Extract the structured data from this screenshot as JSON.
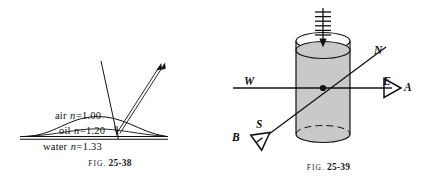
{
  "page": {
    "background_color": "#ffffff",
    "ink_color": "#111111",
    "width": 437,
    "height": 184
  },
  "figures": [
    {
      "id": "fig-25-38",
      "caption_prefix": "FIG.",
      "caption_number": "25-38",
      "description": "Light ray striking an oil film floating on water, showing reflected and refracted rays",
      "labels": [
        {
          "name": "air-label",
          "medium": "air",
          "symbol": "n",
          "equals": "=",
          "value": "1.00"
        },
        {
          "name": "oil-label",
          "medium": "oil",
          "symbol": "n",
          "equals": "=",
          "value": "1.20"
        },
        {
          "name": "water-label",
          "medium": "water",
          "symbol": "n",
          "equals": "=",
          "value": "1.33"
        }
      ]
    },
    {
      "id": "fig-25-39",
      "caption_prefix": "FIG.",
      "caption_number": "25-39",
      "description": "Cylindrical vessel of liquid viewed along an east-west line and a south-north line by two observers",
      "labels": [
        {
          "name": "compass-label-north",
          "text": "N"
        },
        {
          "name": "compass-label-south",
          "text": "S"
        },
        {
          "name": "compass-label-east",
          "text": "E"
        },
        {
          "name": "compass-label-west",
          "text": "W"
        },
        {
          "name": "observer-label-a",
          "text": "A"
        },
        {
          "name": "observer-label-b",
          "text": "B"
        }
      ],
      "liquid_fill_color": "#c9c9c9"
    }
  ]
}
